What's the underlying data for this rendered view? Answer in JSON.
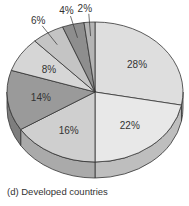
{
  "chart_data": {
    "type": "pie",
    "style": "3d-tilted",
    "title": "(d) Developed countries",
    "start_angle": "12 o'clock, clockwise",
    "slices": [
      {
        "label": "28%",
        "value": 28,
        "color": "#dedede"
      },
      {
        "label": "22%",
        "value": 22,
        "color": "#e8e8e8"
      },
      {
        "label": "16%",
        "value": 16,
        "color": "#cfcfcf"
      },
      {
        "label": "14%",
        "value": 14,
        "color": "#9a9a9a"
      },
      {
        "label": "8%",
        "value": 8,
        "color": "#d6d6d6"
      },
      {
        "label": "6%",
        "value": 6,
        "color": "#c4c4c4"
      },
      {
        "label": "4%",
        "value": 4,
        "color": "#8e8e8e"
      },
      {
        "label": "2%",
        "value": 2,
        "color": "#b4b4b4"
      }
    ]
  },
  "caption": "(d) Developed countries"
}
